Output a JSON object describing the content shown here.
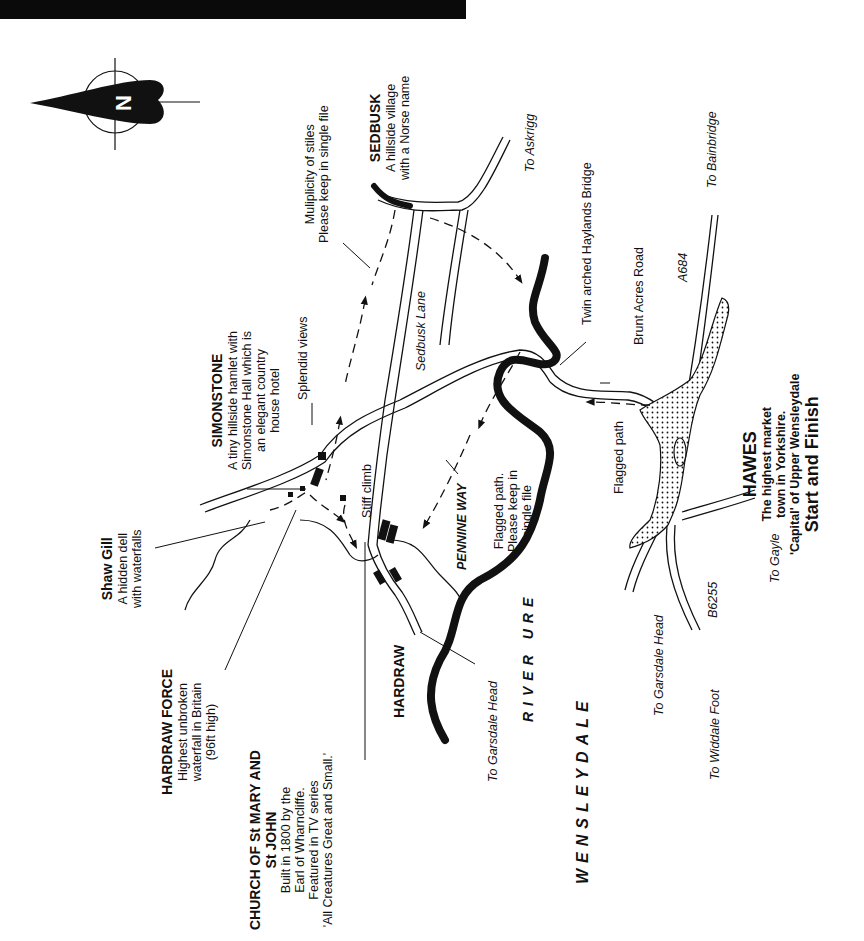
{
  "map": {
    "compass": {
      "icon": "north-arrow-icon",
      "letter": "N"
    },
    "colors": {
      "ink": "#111111",
      "paper": "#ffffff",
      "header_bar": "#0a0a0a"
    },
    "places": {
      "sedbusk": {
        "title": "SEDBUSK",
        "lines": [
          "A hillside village",
          "with a Norse name"
        ]
      },
      "simonstone": {
        "title": "SIMONSTONE",
        "lines": [
          "A tiny hillside hamlet with",
          "Simonstone Hall which is",
          "an elegant country",
          "house hotel"
        ]
      },
      "shaw_gill": {
        "title": "Shaw Gill",
        "lines": [
          "A hidden dell",
          "with waterfalls"
        ]
      },
      "hardraw_force": {
        "title": "HARDRAW FORCE",
        "lines": [
          "Highest unbroken",
          "waterfall in Britain",
          "(96ft high)"
        ]
      },
      "church": {
        "title_lines": [
          "CHURCH OF St MARY AND",
          "St JOHN"
        ],
        "lines": [
          "Built in 1800 by the",
          "Earl of Wharncliffe.",
          "Featured in TV series",
          "'All Creatures Great and Small.'"
        ]
      },
      "hardraw": {
        "title": "HARDRAW"
      },
      "hawes": {
        "title": "HAWES",
        "lines": [
          "The highest market",
          "town in Yorkshire.",
          "'Capital' of Upper Wensleydale"
        ],
        "start_finish": "Start and Finish"
      }
    },
    "notes": {
      "stiles": [
        "Muliplicity of stiles",
        "Please keep in single file"
      ],
      "splendid_views": "Splendid views",
      "stiff_climb": "Stiff climb",
      "flagged_path_pennine": [
        "Flagged path.",
        "Please keep in",
        "single file"
      ],
      "flagged_path_hawes": "Flagged path",
      "haylands_bridge": "Twin arched Haylands Bridge",
      "brunt_acres": "Brunt Acres Road"
    },
    "roads": {
      "sedbusk_lane": "Sedbusk Lane",
      "pennine_way": "PENNINE WAY",
      "a684": "A684",
      "b6255": "B6255"
    },
    "directions": {
      "askrigg": "To Askrigg",
      "bainbridge": "To Bainbridge",
      "gayle": "To Gayle",
      "garsdale_head_1": "To Garsdale Head",
      "garsdale_head_2": "To Garsdale Head",
      "widdale_foot": "To Widdale Foot"
    },
    "areas": {
      "river": "RIVER URE",
      "dale": "WENSLEYDALE"
    }
  }
}
